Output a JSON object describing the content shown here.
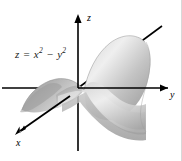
{
  "figure": {
    "background_color": "#ffffff",
    "width": 182,
    "height": 161,
    "equation": {
      "lhs": "z",
      "equals": "=",
      "term1_base": "x",
      "term1_exp": "2",
      "operator": "−",
      "term2_base": "y",
      "term2_exp": "2",
      "plain": "z = x² − y²"
    },
    "axes": {
      "z_label": "z",
      "y_label": "y",
      "x_label": "x",
      "color": "#000000",
      "origin_x": 78,
      "origin_y": 88
    },
    "surface": {
      "type": "saddle",
      "fill_light": "#f2f2f2",
      "fill_mid": "#b9b9b9",
      "fill_dark": "#8c8c8c",
      "outline_color": "#9a9a9a"
    }
  }
}
